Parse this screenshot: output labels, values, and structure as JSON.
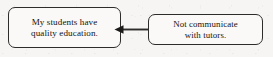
{
  "figure": {
    "type": "cause-effect-flow",
    "background_color": "#f6f5f3",
    "line_color": "#2e2c2b",
    "text_color": "#141312",
    "nodes": [
      {
        "id": "effect",
        "role": "effect",
        "text": "My students have\nquality education.",
        "lines": [
          "My students have",
          "quality education."
        ]
      },
      {
        "id": "cause",
        "role": "cause",
        "text": "Not communicate\nwith tutors.",
        "lines": [
          "Not communicate",
          "with tutors."
        ]
      }
    ],
    "connector": {
      "id": "cause-to-effect-arrow",
      "from": "cause",
      "to": "effect",
      "direction": "left",
      "style": "solid-line-filled-arrowhead"
    }
  }
}
